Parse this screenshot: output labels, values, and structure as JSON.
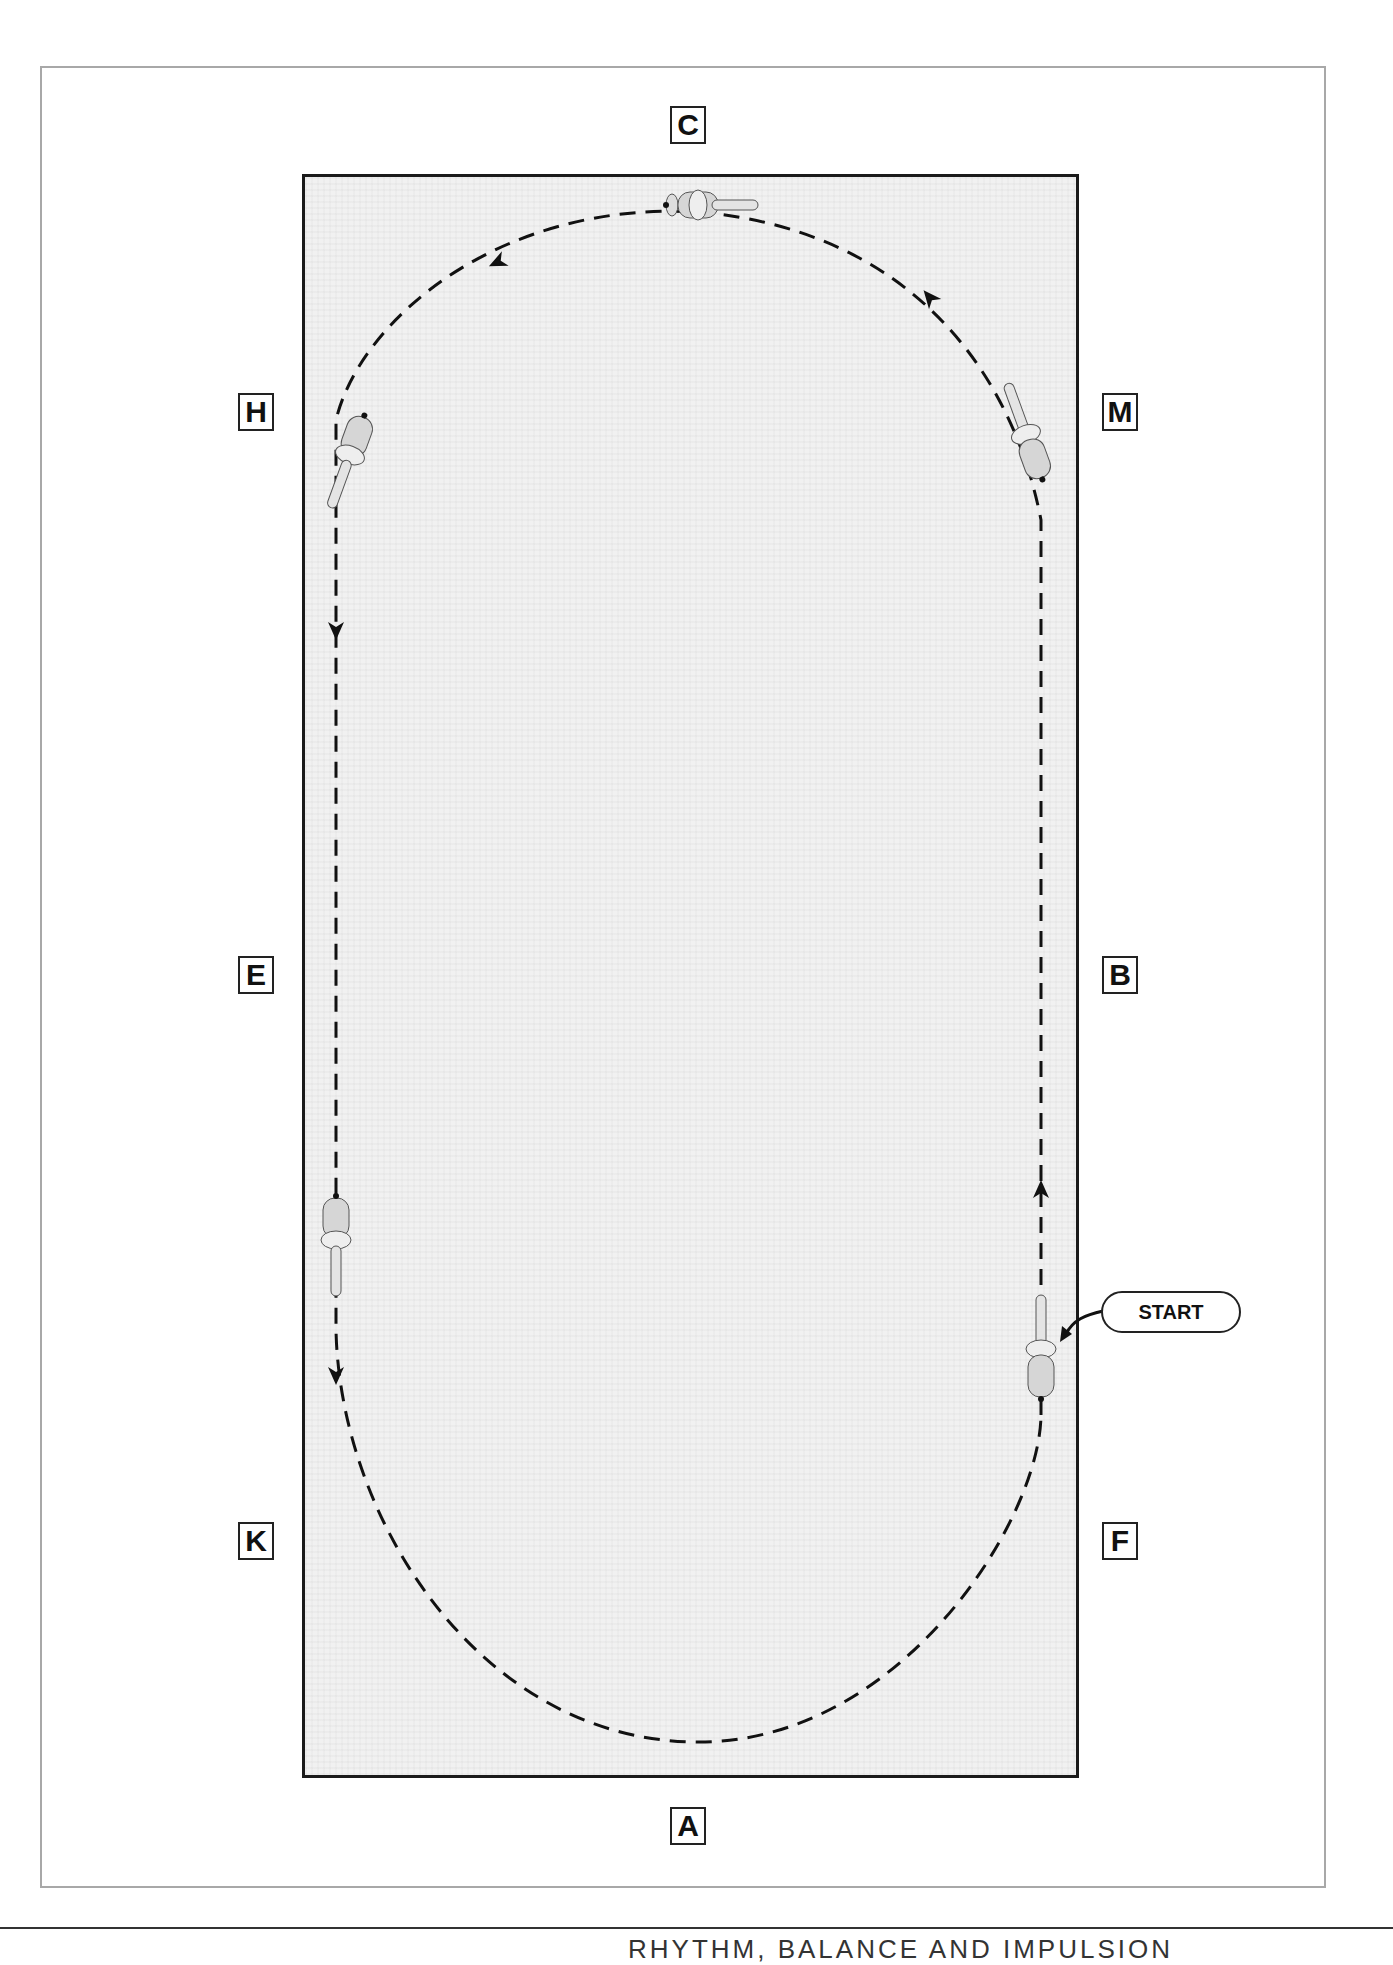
{
  "diagram": {
    "type": "dressage-arena-figure",
    "markers": {
      "C": "C",
      "H": "H",
      "M": "M",
      "E": "E",
      "B": "B",
      "K": "K",
      "F": "F",
      "A": "A"
    },
    "start_label": "START",
    "path_style": "dashed",
    "direction_arrows": 6,
    "horse_figures": 5
  },
  "footer": {
    "running_head": "RHYTHM, BALANCE AND IMPULSION"
  },
  "colors": {
    "arena_border": "#1a1a1a",
    "arena_fill": "#f1f1f1",
    "frame": "#a8a8a8",
    "path": "#111111"
  }
}
